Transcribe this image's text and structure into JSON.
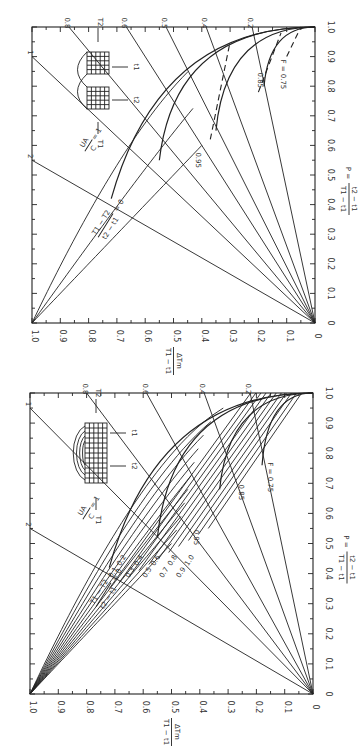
{
  "chart_data": [
    {
      "type": "line",
      "title": "Cross-flow exchanger LMTD chart (two passes)",
      "orientation": "rotated-90-clockwise",
      "xlabel": "P = (t2 - t1)/(T1 - t1)",
      "ylabel": "ΔTm/(T1 - t1)",
      "xlim": [
        0,
        1.0
      ],
      "ylim": [
        0,
        1.0
      ],
      "x_ticks": [
        "0",
        "0.1",
        "0.2",
        "0.3",
        "0.4",
        "0.5",
        "0.6",
        "0.7",
        "0.8",
        "0.9",
        "1.0"
      ],
      "y_ticks": [
        "1.0",
        "0.9",
        "0.8",
        "0.7",
        "0.6",
        "0.5",
        "0.4",
        "0.3",
        "0.2",
        "0.1",
        "0"
      ],
      "ratio_label": "(T1 - T2)/(t2 - t1) = 0",
      "ratio_values": [
        0,
        0.5,
        1.0
      ],
      "ua_label": "UA/C = 1",
      "ua_lines": [
        "2",
        "1",
        "0.8",
        "0.6",
        "0.5",
        "0.4",
        "0.2"
      ],
      "f_lines": [
        "0.95",
        "0.85",
        "F = 0.75"
      ],
      "annotations": [
        "T1",
        "T2",
        "t1",
        "t2"
      ]
    },
    {
      "type": "line",
      "title": "Multi-pass exchanger LMTD chart",
      "orientation": "rotated-90-clockwise",
      "xlabel": "P = (t2 - t1)/(T1 - t1)",
      "ylabel": "ΔTm/(T1 - t1)",
      "xlim": [
        0,
        1.0
      ],
      "ylim": [
        0,
        1.0
      ],
      "x_ticks": [
        "0",
        "0.1",
        "0.2",
        "0.3",
        "0.4",
        "0.5",
        "0.6",
        "0.7",
        "0.8",
        "0.9",
        "1.0"
      ],
      "y_ticks": [
        "1.0",
        "0.9",
        "0.8",
        "0.7",
        "0.6",
        "0.5",
        "0.4",
        "0.3",
        "0.2",
        "0.1",
        "0"
      ],
      "ratio_label": "(T1 - T2)/(t2 - t1) = 0",
      "ratio_values": [
        0,
        0.1,
        0.2,
        0.3,
        0.4,
        0.5,
        0.6,
        0.7,
        0.8,
        0.9,
        1.0
      ],
      "ratio_labels": [
        "0.1",
        "0.2",
        "0.3",
        "0.4",
        "0.5",
        "0.6",
        "0.7",
        "0.8",
        "0.9",
        "1.0"
      ],
      "ua_label": "UA/C = 1",
      "ua_lines": [
        "2",
        "1",
        "0.8",
        "0.6",
        "0.4",
        "0.2"
      ],
      "f_lines": [
        "0.95",
        "0.85",
        "F = 0.75"
      ],
      "annotations": [
        "T1",
        "T2",
        "t1",
        "t2"
      ]
    }
  ],
  "labels": {
    "p_axis": "P =",
    "p_num": "t2 − t1",
    "p_den": "T1 − t1",
    "y_num": "ΔTm",
    "y_den": "T1 − t1",
    "ratio_num": "T1 − T2",
    "ratio_den": "t2 − t1",
    "ratio_eq": "= 0",
    "ua_num": "UA",
    "ua_den": "C",
    "ua_eq": "= 1",
    "T1": "T1",
    "T2": "T2",
    "t1": "t1",
    "t2": "t2",
    "f75": "F = 0.75",
    "f85": "0.85",
    "f95": "0.95"
  }
}
